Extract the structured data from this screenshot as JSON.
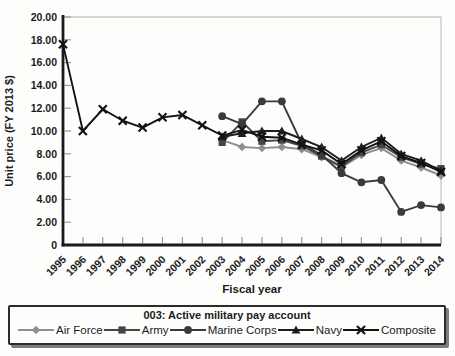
{
  "chart_data": {
    "type": "line",
    "title": "",
    "xlabel": "Fiscal year",
    "ylabel": "Unit price (FY 2013 $)",
    "ylim": [
      0,
      20
    ],
    "ytick_step": 2,
    "y_tick_labels": [
      "0",
      "2.00",
      "4.00",
      "6.00",
      "8.00",
      "10.00",
      "12.00",
      "14.00",
      "16.00",
      "18.00",
      "20.00"
    ],
    "grid": "top-and-right-border-only",
    "x": [
      "1995",
      "1996",
      "1997",
      "1998",
      "1999",
      "2000",
      "2001",
      "2002",
      "2003",
      "2004",
      "2005",
      "2006",
      "2007",
      "2008",
      "2009",
      "2010",
      "2011",
      "2012",
      "2013",
      "2014"
    ],
    "series": [
      {
        "name": "Air Force",
        "marker": "diamond",
        "color": "#8f8f8f",
        "values": [
          null,
          null,
          null,
          null,
          null,
          null,
          null,
          null,
          9.2,
          8.6,
          8.5,
          8.6,
          8.4,
          7.7,
          6.8,
          7.9,
          8.5,
          7.4,
          6.8,
          6.1
        ]
      },
      {
        "name": "Army",
        "marker": "square",
        "color": "#454545",
        "values": [
          null,
          null,
          null,
          null,
          null,
          null,
          null,
          null,
          9.0,
          10.8,
          9.1,
          9.2,
          8.7,
          7.8,
          6.9,
          8.1,
          8.8,
          7.7,
          7.1,
          6.7
        ]
      },
      {
        "name": "Marine Corps",
        "marker": "circle",
        "color": "#3a3a3a",
        "values": [
          null,
          null,
          null,
          null,
          null,
          null,
          null,
          null,
          11.3,
          10.6,
          12.6,
          12.6,
          8.9,
          7.9,
          6.3,
          5.5,
          5.7,
          2.9,
          3.5,
          3.3
        ]
      },
      {
        "name": "Navy",
        "marker": "triangle",
        "color": "#1e1e1e",
        "values": [
          null,
          null,
          null,
          null,
          null,
          null,
          null,
          null,
          9.5,
          9.8,
          10.0,
          10.0,
          9.3,
          8.6,
          7.4,
          8.6,
          9.4,
          8.0,
          7.4,
          6.5
        ]
      },
      {
        "name": "Composite",
        "marker": "x",
        "color": "#121212",
        "values": [
          17.6,
          10.0,
          11.9,
          10.9,
          10.3,
          11.2,
          11.4,
          10.5,
          9.6,
          10.1,
          9.5,
          9.4,
          8.8,
          8.3,
          7.1,
          8.3,
          9.1,
          7.8,
          7.2,
          6.4
        ]
      }
    ],
    "legend": {
      "title": "003: Active military pay account",
      "position": "bottom"
    }
  },
  "colors": {
    "axis": "#1b1b1b",
    "grid_border": "#c8c8c6",
    "tick": "#9a9a98",
    "background": "#fdfdfb",
    "legend_border": "#2b2b2b"
  }
}
